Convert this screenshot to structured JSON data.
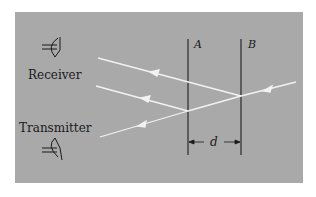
{
  "diagram": {
    "labels": {
      "receiver": "Receiver",
      "transmitter": "Transmitter",
      "plate_a": "A",
      "plate_b": "B",
      "separation": "d"
    },
    "colors": {
      "background": "#a9a9a9",
      "rays": "#f2f2f2",
      "plates": "#2a2a2a",
      "text": "#1a1a1a"
    },
    "icons": {
      "receiver": "horn-antenna-icon",
      "transmitter": "horn-antenna-icon"
    }
  }
}
